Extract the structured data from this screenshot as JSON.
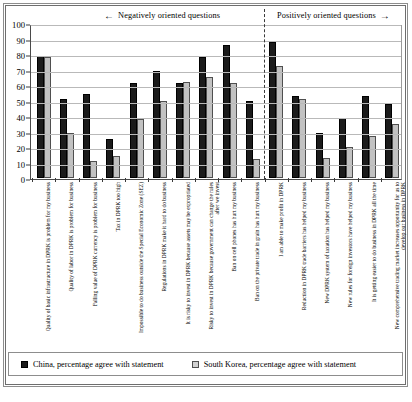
{
  "chart_data": {
    "type": "bar",
    "title": "",
    "xlabel": "",
    "ylabel": "",
    "ylim": [
      0,
      100
    ],
    "ytick_step": 10,
    "grid": true,
    "legend_position": "bottom",
    "categories": [
      "Quality of basic infrastructure in DPRK is problem for my business",
      "Quality of labor in DPRK is problem for business",
      "Falling value of DPRK currency is problem for business",
      "Tax in DPRK too high",
      "Impossible to do business outside the Special Economic Zone (SEZ)",
      "Regulations in DPRK make it hard to do business",
      "It is risky to invest in DPRK because assets may be expropriated",
      "Risky to invest in DPRK because government can change the rules after we invest",
      "Ban on cell phones has hurt my business",
      "Ban on the private trade in grain has hurt my business",
      "I am able to make profit in DPRK",
      "Reduction in DPRK trade barriers has helped my business",
      "New DPRK system of taxation has helped my business",
      "New rules for foreign investors have helped my business",
      "It is getting easier to do business in DPRK all the time",
      "New comprehensive trading market increases opportunity for us to develop our business in DPRK"
    ],
    "series": [
      {
        "name": "China, percentage agree with statement",
        "color": "#1b1b1b",
        "values": [
          79,
          51,
          54,
          25,
          61,
          69,
          61,
          78,
          86,
          50,
          88,
          53,
          29,
          39,
          53,
          48
        ]
      },
      {
        "name": "South Korea, percentage agree with statement",
        "color": "#c2c2c2",
        "values": [
          78,
          29,
          11,
          14,
          38,
          50,
          62,
          65,
          61,
          12,
          72,
          51,
          13,
          20,
          27,
          35
        ]
      }
    ],
    "ytick_labels": [
      "0",
      "10",
      "20",
      "30",
      "40",
      "50",
      "60",
      "70",
      "80",
      "90",
      "100"
    ],
    "annotations": {
      "negative_section_label": "Negatively oriented questions",
      "negative_arrow": "←",
      "positive_section_label": "Positively oriented questions",
      "positive_arrow": "→",
      "divider_after_category_index": 9
    }
  },
  "legend": {
    "items": [
      {
        "label": "China, percentage agree with statement",
        "swatch": "china"
      },
      {
        "label": "South Korea, percentage agree with statement",
        "swatch": "korea"
      }
    ]
  }
}
